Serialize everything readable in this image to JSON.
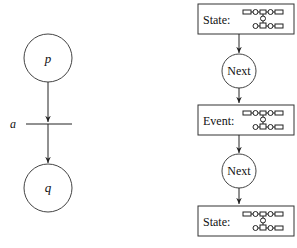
{
  "left_net": {
    "places": [
      {
        "id": "p",
        "label": "p"
      },
      {
        "id": "q",
        "label": "q"
      }
    ],
    "transition": {
      "id": "a",
      "label": "a"
    },
    "arcs": [
      {
        "from": "p",
        "to": "a"
      },
      {
        "from": "a",
        "to": "q"
      }
    ]
  },
  "right_chain": {
    "nodes": [
      {
        "kind": "box",
        "label": "State:",
        "glyph": "mini-petri-net"
      },
      {
        "kind": "circle",
        "label": "Next"
      },
      {
        "kind": "box",
        "label": "Event:",
        "glyph": "mini-petri-net"
      },
      {
        "kind": "circle",
        "label": "Next"
      },
      {
        "kind": "box",
        "label": "State:",
        "glyph": "mini-petri-net"
      }
    ]
  },
  "colors": {
    "line": "#222222",
    "background": "#ffffff",
    "text": "#111111"
  }
}
